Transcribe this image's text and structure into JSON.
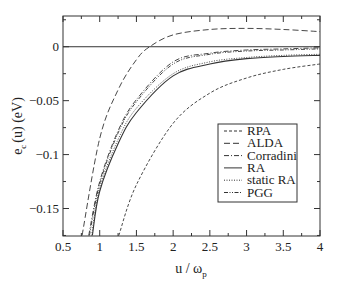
{
  "chart_data": {
    "type": "line",
    "title": "",
    "xlabel": "u / ω",
    "xlabel_sub": "p",
    "ylabel": "e",
    "ylabel_sub": "c",
    "ylabel_rest": "(u)  (eV)",
    "xlim": [
      0.5,
      4.0
    ],
    "ylim": [
      -0.175,
      0.028
    ],
    "grid": false,
    "legend_position": "lower right (inside)",
    "x_ticks": [
      0.5,
      1,
      1.5,
      2,
      2.5,
      3,
      3.5,
      4
    ],
    "x_tick_labels": [
      "0.5",
      "1",
      "1.5",
      "2",
      "2.5",
      "3",
      "3.5",
      "4"
    ],
    "y_ticks": [
      0,
      -0.05,
      -0.1,
      -0.15
    ],
    "y_tick_labels": [
      "0",
      "-0.05",
      "-0.1",
      "-0.15"
    ],
    "reference_line": {
      "y": 0,
      "style": "solid"
    },
    "series": [
      {
        "name": "RPA",
        "style": "dashed-short",
        "dash": "3,2",
        "x": [
          1.26,
          1.5,
          2.0,
          2.5,
          3.0,
          3.5,
          4.0
        ],
        "y": [
          -0.175,
          -0.128,
          -0.071,
          -0.043,
          -0.029,
          -0.021,
          -0.016
        ]
      },
      {
        "name": "ALDA",
        "style": "dashed-long",
        "dash": "6,3",
        "x": [
          0.76,
          1.0,
          1.25,
          1.5,
          1.68,
          2.0,
          2.5,
          3.0,
          3.5,
          4.0
        ],
        "y": [
          -0.175,
          -0.085,
          -0.04,
          -0.012,
          0.0,
          0.011,
          0.016,
          0.017,
          0.016,
          0.014
        ]
      },
      {
        "name": "Corradini",
        "style": "dash-dot",
        "dash": "5,2,1,2",
        "x": [
          0.85,
          1.0,
          1.25,
          1.5,
          2.0,
          2.5,
          3.0,
          3.5,
          4.0
        ],
        "y": [
          -0.175,
          -0.125,
          -0.078,
          -0.049,
          -0.014,
          -0.006,
          -0.003,
          -0.002,
          -0.001
        ]
      },
      {
        "name": "RA",
        "style": "solid",
        "dash": "",
        "x": [
          0.9,
          1.0,
          1.25,
          1.5,
          2.0,
          2.5,
          3.0,
          3.5,
          4.0
        ],
        "y": [
          -0.175,
          -0.134,
          -0.09,
          -0.061,
          -0.027,
          -0.016,
          -0.011,
          -0.009,
          -0.008
        ]
      },
      {
        "name": "static RA",
        "style": "dotted",
        "dash": "1,1.5",
        "x": [
          0.89,
          1.0,
          1.25,
          1.5,
          2.0,
          2.5,
          3.0,
          3.5,
          4.0
        ],
        "y": [
          -0.175,
          -0.131,
          -0.086,
          -0.057,
          -0.025,
          -0.014,
          -0.01,
          -0.008,
          -0.007
        ]
      },
      {
        "name": "PGG",
        "style": "dash-dot-dot",
        "dash": "4,1.5,1,1.5,1,1.5",
        "x": [
          0.86,
          1.0,
          1.25,
          1.5,
          2.0,
          2.5,
          3.0,
          3.5,
          4.0
        ],
        "y": [
          -0.175,
          -0.127,
          -0.08,
          -0.051,
          -0.016,
          -0.007,
          -0.004,
          -0.003,
          -0.002
        ]
      }
    ]
  }
}
